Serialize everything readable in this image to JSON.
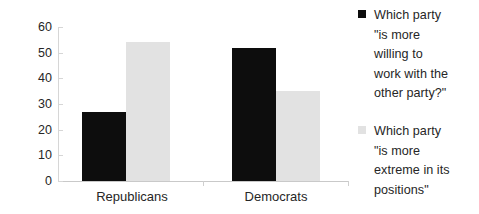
{
  "chart_data": {
    "type": "bar",
    "title": "",
    "subtitle": "",
    "xlabel": "",
    "ylabel": "",
    "categories": [
      "Republicans",
      "Democrats"
    ],
    "series": [
      {
        "name": "Which party \"is more willing to work with the other party?\"",
        "color": "#0d0d0d",
        "values": [
          27,
          52
        ]
      },
      {
        "name": "Which party \"is more extreme in its positions\"",
        "color": "#e2e2e2",
        "values": [
          54,
          35
        ]
      }
    ],
    "ylim": [
      0,
      60
    ],
    "yticks": [
      0,
      10,
      20,
      30,
      40,
      50,
      60
    ],
    "ytick_labels": [
      "0",
      "10",
      "20",
      "30",
      "40",
      "50",
      "60"
    ],
    "grid": false,
    "legend_position": "right"
  },
  "axis": {
    "y_labels": [
      "60",
      "50",
      "40",
      "30",
      "20",
      "10",
      "0"
    ]
  },
  "categories": [
    {
      "label": "Republicans"
    },
    {
      "label": "Democrats"
    }
  ],
  "legend": {
    "items": [
      {
        "swatch": "black-square",
        "text": "Which party\n\"is more\nwilling to\nwork with the\nother party?\""
      },
      {
        "swatch": "light-gray-square",
        "text": "Which party\n\"is more\nextreme in its\npositions\""
      }
    ]
  }
}
